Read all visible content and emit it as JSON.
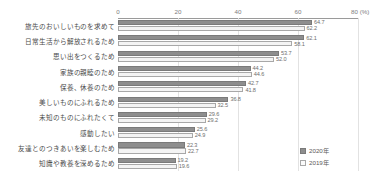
{
  "crop_text": "",
  "legend": {
    "position": "bottom-right",
    "entries": [
      {
        "label": "2020年",
        "color": "#8e8e8e",
        "key": "y2020"
      },
      {
        "label": "2019年",
        "color": "#f4f4f4",
        "key": "y2019"
      }
    ]
  },
  "axis": {
    "unit_suffix": "(%)",
    "ticks": [
      "0",
      "20",
      "40",
      "60",
      "80"
    ]
  },
  "chart_data": {
    "type": "bar",
    "orientation": "horizontal",
    "title": "",
    "subtitle": "",
    "xlabel": "(%)",
    "ylabel": "",
    "xlim": [
      0,
      80
    ],
    "xticks": [
      0,
      20,
      40,
      60,
      80
    ],
    "grid": true,
    "legend_position": "bottom-right",
    "categories": [
      "旅先のおいしいものを求めて",
      "日常生活から解放されるため",
      "思い出をつくるため",
      "家族の親睦のため",
      "保養、休養のため",
      "美しいものにふれるため",
      "未知のものにふれたくて",
      "感動したい",
      "友達とのつきあいを楽しむため",
      "知識や教養を深めるため"
    ],
    "series": [
      {
        "name": "2020年",
        "values": [
          64.7,
          62.1,
          53.7,
          44.2,
          42.7,
          36.8,
          29.6,
          25.6,
          22.3,
          19.2
        ]
      },
      {
        "name": "2019年",
        "values": [
          62.2,
          58.1,
          52.0,
          44.6,
          41.8,
          32.5,
          29.2,
          24.9,
          22.7,
          19.6
        ]
      }
    ]
  }
}
